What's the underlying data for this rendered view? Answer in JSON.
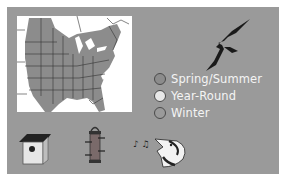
{
  "range_map": {
    "region": "Eastern North America",
    "colors": {
      "background": "#9a9a9a",
      "map_background": "#ffffff",
      "range_fill": "#8c8c8c",
      "state_lines": "#333333"
    }
  },
  "legend": {
    "items": [
      {
        "label": "Spring/Summer",
        "swatch": "#8c8c8c"
      },
      {
        "label": "Year-Round",
        "swatch": "#e8e8e8"
      },
      {
        "label": "Winter",
        "swatch": "#9a9a9a"
      }
    ]
  },
  "icons": {
    "bird": "flying-swallow-silhouette",
    "nesting": "birdhouse-icon",
    "feeder": "tube-feeder-icon",
    "song": "singing-bird-icon"
  }
}
